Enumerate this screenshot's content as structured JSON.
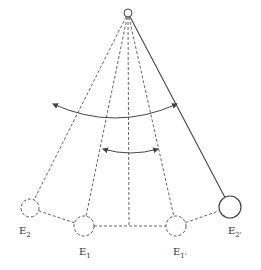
{
  "diagram": {
    "pivot": {
      "x": 128,
      "y": 13,
      "r": 4
    },
    "bobs": [
      {
        "id": "E2",
        "label": "E",
        "sub": "2",
        "x": 30,
        "y": 208,
        "r": 9,
        "style": "dashed",
        "label_x": 19,
        "label_y": 225
      },
      {
        "id": "E1",
        "label": "E",
        "sub": "1",
        "x": 84,
        "y": 226,
        "r": 10,
        "style": "dashed",
        "label_x": 79,
        "label_y": 246
      },
      {
        "id": "E1p",
        "label": "E",
        "sub": "1'",
        "x": 176,
        "y": 226,
        "r": 10,
        "style": "dashed",
        "label_x": 173,
        "label_y": 246
      },
      {
        "id": "E2p",
        "label": "E",
        "sub": "2'",
        "x": 230,
        "y": 207,
        "r": 11,
        "style": "solid",
        "label_x": 228,
        "label_y": 225
      }
    ],
    "center_line": {
      "x": 129,
      "y_end": 226
    },
    "arcs": [
      {
        "name": "outer-arc",
        "from": [
          53,
          104
        ],
        "to": [
          177,
          104
        ],
        "sag": 14
      },
      {
        "name": "inner-arc",
        "from": [
          103,
          149
        ],
        "to": [
          158,
          149
        ],
        "sag": 4
      }
    ],
    "colors": {
      "line": "#444444",
      "dashed": "#555555"
    }
  }
}
